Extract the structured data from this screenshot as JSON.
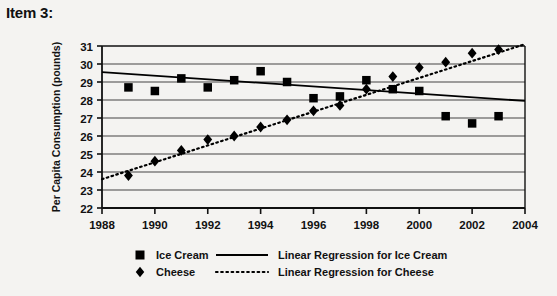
{
  "item": {
    "label": "Item 3:"
  },
  "chart_data": {
    "type": "scatter",
    "title": "",
    "xlabel": "",
    "ylabel": "Per Capita Consumption (pounds)",
    "xlim": [
      1988,
      2004
    ],
    "ylim": [
      22,
      31
    ],
    "xticks": [
      1988,
      1990,
      1992,
      1994,
      1996,
      1998,
      2000,
      2002,
      2004
    ],
    "yticks": [
      22,
      23,
      24,
      25,
      26,
      27,
      28,
      29,
      30,
      31
    ],
    "grid": "horizontal",
    "legend_position": "bottom",
    "x": [
      1989,
      1990,
      1991,
      1992,
      1993,
      1994,
      1995,
      1996,
      1997,
      1998,
      1999,
      2000,
      2001,
      2002,
      2003
    ],
    "series": [
      {
        "name": "Ice Cream",
        "marker": "square",
        "color": "#000000",
        "values": [
          28.7,
          28.5,
          29.2,
          28.7,
          29.1,
          29.6,
          29.0,
          28.1,
          28.2,
          29.1,
          28.6,
          28.5,
          27.1,
          26.7,
          27.1
        ]
      },
      {
        "name": "Cheese",
        "marker": "diamond",
        "color": "#000000",
        "values": [
          23.8,
          24.6,
          25.2,
          25.8,
          26.0,
          26.5,
          26.9,
          27.4,
          27.7,
          28.6,
          29.3,
          29.8,
          30.1,
          30.6,
          30.8
        ]
      }
    ],
    "trendlines": [
      {
        "name": "Linear Regression for Ice Cream",
        "style": "solid",
        "color": "#000000",
        "x0": 1988,
        "y0": 29.55,
        "x1": 2004,
        "y1": 27.95
      },
      {
        "name": "Linear Regression for Cheese",
        "style": "dotted",
        "color": "#000000",
        "x0": 1988,
        "y0": 23.6,
        "x1": 2004,
        "y1": 31.1
      }
    ],
    "legend": [
      {
        "label": "Ice Cream",
        "swatch": "square-marker"
      },
      {
        "label": "Linear Regression for Ice Cream",
        "swatch": "solid-line"
      },
      {
        "label": "Cheese",
        "swatch": "diamond-marker"
      },
      {
        "label": "Linear Regression for Cheese",
        "swatch": "dotted-line"
      }
    ],
    "ytick_labels": [
      "31",
      "30",
      "29",
      "28",
      "27",
      "26",
      "25",
      "24",
      "23",
      "22"
    ],
    "xtick_labels": [
      "1988",
      "1990",
      "1992",
      "1994",
      "1996",
      "1998",
      "2000",
      "2002",
      "2004"
    ]
  }
}
